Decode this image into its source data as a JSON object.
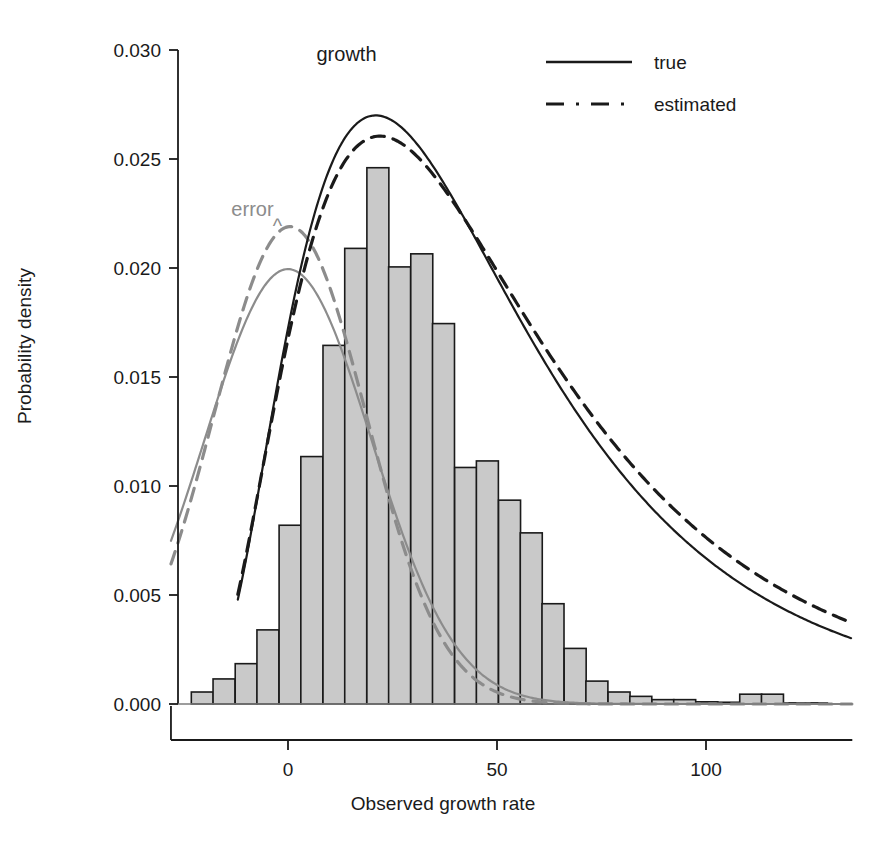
{
  "chart_data": {
    "type": "bar",
    "title": "",
    "xlabel": "Observed growth rate",
    "ylabel": "Probability density",
    "xlim": [
      -28,
      135
    ],
    "ylim": [
      0.0,
      0.0305
    ],
    "xticks": [
      0,
      50,
      100
    ],
    "xtick_labels": [
      "0",
      "50",
      "100"
    ],
    "yticks": [
      0.0,
      0.005,
      0.01,
      0.015,
      0.02,
      0.025,
      0.03
    ],
    "ytick_labels": [
      "0.000",
      "0.005",
      "0.010",
      "0.015",
      "0.020",
      "0.025",
      "0.030"
    ],
    "grid": false,
    "bar_width": 5.26,
    "bar_fill": "#c9c9c9",
    "bar_edge": "#1a1a1a",
    "categories": [
      -20.5,
      -15.3,
      -10.0,
      -4.8,
      0.5,
      5.7,
      11.0,
      16.2,
      21.5,
      26.7,
      32.0,
      37.2,
      42.5,
      47.7,
      53.0,
      58.2,
      63.4,
      68.7,
      73.9,
      79.2,
      84.4,
      89.7,
      94.9,
      100.2,
      105.4,
      110.7,
      115.9,
      121.2,
      126.4
    ],
    "values": [
      0.00055,
      0.00115,
      0.00185,
      0.0034,
      0.0082,
      0.01135,
      0.01645,
      0.0209,
      0.0246,
      0.02005,
      0.02065,
      0.01745,
      0.01085,
      0.01115,
      0.00935,
      0.00785,
      0.0046,
      0.00255,
      0.00105,
      0.00055,
      0.00035,
      0.0002,
      0.0002,
      0.0001,
      8e-05,
      0.00045,
      0.00045,
      5e-05,
      5e-05
    ],
    "series": [
      {
        "name": "error-true",
        "style": "solid",
        "color": "#8c8c8c",
        "distribution": "normal",
        "mean": 0.0,
        "sd": 20.0,
        "peak": 0.01995
      },
      {
        "name": "error-estimated",
        "style": "dashed",
        "color": "#8c8c8c",
        "distribution": "normal",
        "mean": 0.5,
        "sd": 18.2,
        "peak": 0.0219
      },
      {
        "name": "growth-true",
        "style": "solid",
        "color": "#1a1a1a",
        "distribution": "skewed",
        "mean": 21.0,
        "peak": 0.027
      },
      {
        "name": "growth-estimated",
        "style": "dashed",
        "color": "#1a1a1a",
        "distribution": "skewed",
        "mean": 22.0,
        "peak": 0.02605
      }
    ],
    "annotations": [
      {
        "id": "growth",
        "text": "growth",
        "x": 14.0,
        "y": 0.0295,
        "color": "#1a1a1a"
      },
      {
        "id": "error",
        "text": "error",
        "x": -8.5,
        "y": 0.0224,
        "color": "#8c8c8c"
      },
      {
        "id": "error-caret",
        "text": "^",
        "x": -2.5,
        "y": 0.0216,
        "color": "#8c8c8c"
      }
    ],
    "legend": {
      "position": "top-right",
      "entries": [
        {
          "label": "true",
          "style": "solid",
          "color": "#1a1a1a"
        },
        {
          "label": "estimated",
          "style": "dashed",
          "color": "#1a1a1a"
        }
      ]
    }
  },
  "caption": ""
}
